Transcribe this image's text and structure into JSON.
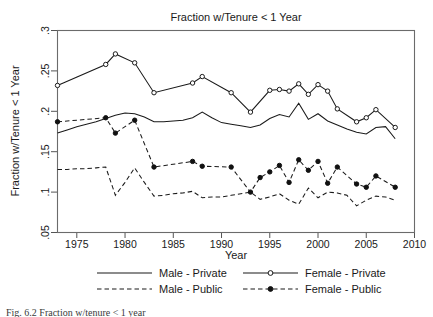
{
  "figure": {
    "title": "Fraction w/Tenure < 1 Year",
    "caption": "Fig. 6.2   Fraction w/tenure < 1 year"
  },
  "axes": {
    "xlabel": "Year",
    "ylabel": "Fraction w/Tenure < 1 Year",
    "xticks": [
      "1975",
      "1980",
      "1985",
      "1990",
      "1995",
      "2000",
      "2005",
      "2010"
    ],
    "yticks": [
      ".05",
      ".1",
      ".15",
      ".2",
      ".25",
      ".3"
    ]
  },
  "legend": {
    "items": [
      {
        "label": "Male - Private",
        "style": "solid",
        "marker": "none"
      },
      {
        "label": "Female - Private",
        "style": "solid",
        "marker": "open-circle"
      },
      {
        "label": "Male - Public",
        "style": "dashed",
        "marker": "none"
      },
      {
        "label": "Female - Public",
        "style": "dashed",
        "marker": "filled-circle"
      }
    ]
  },
  "chart_data": {
    "type": "line",
    "title": "Fraction w/Tenure < 1 Year",
    "xlabel": "Year",
    "ylabel": "Fraction w/Tenure < 1 Year",
    "xlim": [
      1973,
      2010
    ],
    "ylim": [
      0.05,
      0.3
    ],
    "xticks": [
      1975,
      1980,
      1985,
      1990,
      1995,
      2000,
      2005,
      2010
    ],
    "yticks": [
      0.05,
      0.1,
      0.15,
      0.2,
      0.25,
      0.3
    ],
    "grid": false,
    "legend_position": "below",
    "series": [
      {
        "name": "Male - Private",
        "style": "solid",
        "marker": "none",
        "x": [
          1973,
          1974,
          1975,
          1976,
          1977,
          1978,
          1979,
          1980,
          1981,
          1982,
          1983,
          1984,
          1985,
          1986,
          1987,
          1988,
          1989,
          1990,
          1991,
          1992,
          1993,
          1994,
          1995,
          1996,
          1997,
          1998,
          1999,
          2000,
          2001,
          2002,
          2003,
          2004,
          2005,
          2006,
          2007,
          2008
        ],
        "values": [
          0.173,
          0.177,
          0.181,
          0.184,
          0.187,
          0.191,
          0.195,
          0.198,
          0.197,
          0.193,
          0.187,
          0.187,
          0.188,
          0.189,
          0.192,
          0.199,
          0.192,
          0.186,
          0.184,
          0.182,
          0.18,
          0.183,
          0.191,
          0.196,
          0.193,
          0.21,
          0.19,
          0.197,
          0.188,
          0.183,
          0.178,
          0.174,
          0.172,
          0.18,
          0.181,
          0.166
        ]
      },
      {
        "name": "Female - Private",
        "style": "solid",
        "marker": "open-circle",
        "x": [
          1973,
          1978,
          1979,
          1981,
          1983,
          1987,
          1988,
          1991,
          1993,
          1995,
          1996,
          1997,
          1998,
          1999,
          2000,
          2001,
          2002,
          2004,
          2005,
          2006,
          2008
        ],
        "values": [
          0.232,
          0.258,
          0.271,
          0.26,
          0.223,
          0.235,
          0.243,
          0.223,
          0.199,
          0.226,
          0.227,
          0.225,
          0.234,
          0.221,
          0.233,
          0.225,
          0.203,
          0.187,
          0.192,
          0.202,
          0.18
        ]
      },
      {
        "name": "Male - Public",
        "style": "dashed",
        "marker": "none",
        "x": [
          1973,
          1974,
          1975,
          1976,
          1977,
          1978,
          1979,
          1980,
          1981,
          1982,
          1983,
          1984,
          1985,
          1986,
          1987,
          1988,
          1989,
          1990,
          1991,
          1992,
          1993,
          1994,
          1995,
          1996,
          1997,
          1998,
          1999,
          2000,
          2001,
          2002,
          2003,
          2004,
          2005,
          2006,
          2007,
          2008
        ],
        "values": [
          0.128,
          0.128,
          0.129,
          0.129,
          0.13,
          0.131,
          0.096,
          0.112,
          0.13,
          0.112,
          0.095,
          0.096,
          0.098,
          0.099,
          0.101,
          0.093,
          0.094,
          0.094,
          0.096,
          0.098,
          0.1,
          0.091,
          0.094,
          0.098,
          0.09,
          0.085,
          0.105,
          0.093,
          0.1,
          0.099,
          0.096,
          0.083,
          0.09,
          0.095,
          0.094,
          0.09
        ]
      },
      {
        "name": "Female - Public",
        "style": "dashed",
        "marker": "filled-circle",
        "x": [
          1973,
          1978,
          1979,
          1981,
          1983,
          1987,
          1988,
          1991,
          1993,
          1994,
          1995,
          1996,
          1997,
          1998,
          1999,
          2000,
          2001,
          2002,
          2004,
          2005,
          2006,
          2008
        ],
        "values": [
          0.187,
          0.192,
          0.173,
          0.189,
          0.131,
          0.138,
          0.132,
          0.131,
          0.1,
          0.118,
          0.125,
          0.133,
          0.112,
          0.14,
          0.127,
          0.138,
          0.111,
          0.131,
          0.11,
          0.106,
          0.12,
          0.106
        ]
      }
    ]
  }
}
